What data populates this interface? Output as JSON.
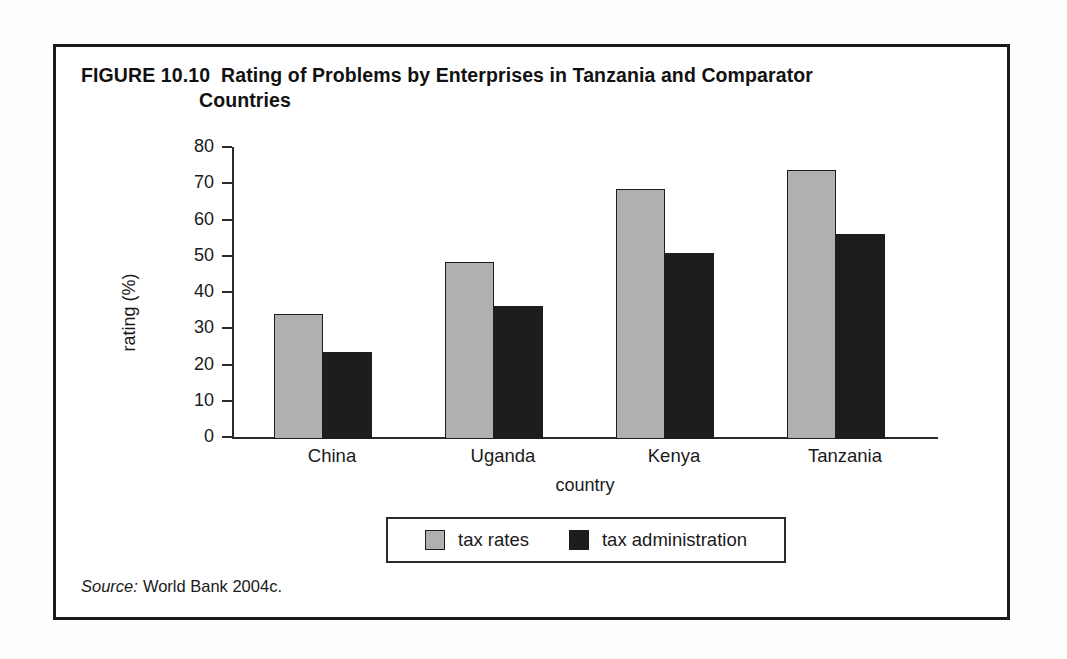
{
  "figure": {
    "label": "FIGURE 10.10",
    "title_line1": "Rating of Problems by Enterprises in Tanzania and Comparator",
    "title_line2": "Countries",
    "source_word": "Source:",
    "source_text": "World Bank 2004c."
  },
  "chart_data": {
    "type": "bar",
    "title": "Rating of Problems by Enterprises in Tanzania and Comparator Countries",
    "categories": [
      "China",
      "Uganda",
      "Kenya",
      "Tanzania"
    ],
    "series": [
      {
        "name": "tax rates",
        "color": "#b0b0b0",
        "values": [
          34.5,
          48.8,
          69.0,
          74.3
        ]
      },
      {
        "name": "tax administration",
        "color": "#1d1d1d",
        "values": [
          24.0,
          36.7,
          51.2,
          56.5
        ]
      }
    ],
    "xlabel": "country",
    "ylabel": "rating (%)",
    "ylim": [
      0,
      80
    ],
    "yticks": [
      0,
      10,
      20,
      30,
      40,
      50,
      60,
      70,
      80
    ],
    "ytick_labels": [
      "0",
      "10",
      "20",
      "30",
      "40",
      "50",
      "60",
      "70",
      "80"
    ],
    "grid": false,
    "legend_position": "bottom"
  }
}
